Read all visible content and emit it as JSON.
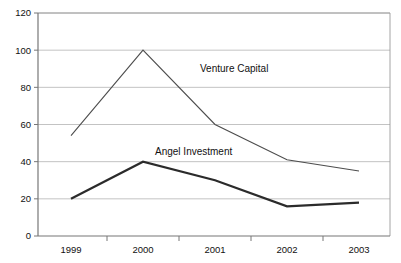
{
  "chart_data": {
    "type": "line",
    "title": "",
    "xlabel": "",
    "ylabel": "",
    "categories": [
      "1999",
      "2000",
      "2001",
      "2002",
      "2003"
    ],
    "x_tick_labels": [
      "1999",
      "2000",
      "2001",
      "2002",
      "2003"
    ],
    "y_tick_labels": [
      "0",
      "20",
      "40",
      "60",
      "80",
      "100",
      "120"
    ],
    "y_ticks": [
      0,
      20,
      40,
      60,
      80,
      100,
      120
    ],
    "ylim": [
      0,
      120
    ],
    "grid": "horizontal",
    "legend_position": "inline-annotations",
    "series": [
      {
        "name": "Venture Capital",
        "values": [
          54,
          100,
          60,
          41,
          35
        ],
        "color": "#4d4d4d",
        "stroke_width": 1.1,
        "label": "Venture Capital",
        "label_x": 200,
        "label_y": 72
      },
      {
        "name": "Angel Investment",
        "values": [
          20,
          40,
          30,
          16,
          18
        ],
        "color": "#2b2b2b",
        "stroke_width": 2.2,
        "label": "Angel Investment",
        "label_x": 155,
        "label_y": 155
      }
    ],
    "annotations": [
      {
        "text": "Venture Capital"
      },
      {
        "text": "Angel Investment"
      }
    ]
  }
}
